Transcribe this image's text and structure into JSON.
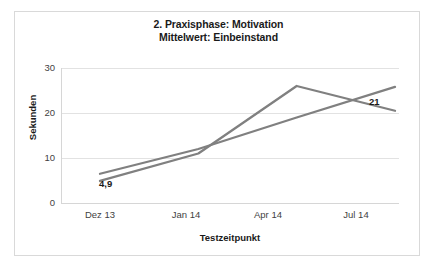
{
  "chart_data": {
    "type": "line",
    "title": "2. Praxisphase: Motivation\nMittelwert: Einbeinstand",
    "title_lines": [
      "2. Praxisphase: Motivation",
      "Mittelwert: Einbeinstand"
    ],
    "xlabel": "Testzeitpunkt",
    "ylabel": "Sekunden",
    "categories": [
      "Dez 13",
      "Jan 14",
      "Apr 14",
      "Jul 14"
    ],
    "ylim": [
      0,
      30
    ],
    "yticks": [
      0,
      10,
      20,
      30
    ],
    "ytick_labels": [
      "0",
      "10",
      "20",
      "30"
    ],
    "grid": true,
    "grid_axis": "y",
    "legend": false,
    "legend_position": "none",
    "series": [
      {
        "name": "series-1",
        "color": "#808080",
        "values": [
          4.9,
          11.0,
          26.0,
          20.5
        ]
      },
      {
        "name": "series-2",
        "color": "#808080",
        "values": [
          6.5,
          12.0,
          19.0,
          25.8
        ]
      }
    ],
    "annotations": [
      {
        "name": "start-value",
        "text": "4,9",
        "series": "series-1",
        "category": "Dez 13"
      },
      {
        "name": "end-value",
        "text": "21",
        "series": "series-1",
        "category": "Jul 14"
      }
    ],
    "colors": {
      "series": "#808080",
      "gridline": "#e2e2e2",
      "axis": "#d6d6d6",
      "text": "#1a1a1a",
      "tick_text": "#3f3f3f",
      "frame": "#d9d9d9",
      "background": "#ffffff"
    }
  }
}
